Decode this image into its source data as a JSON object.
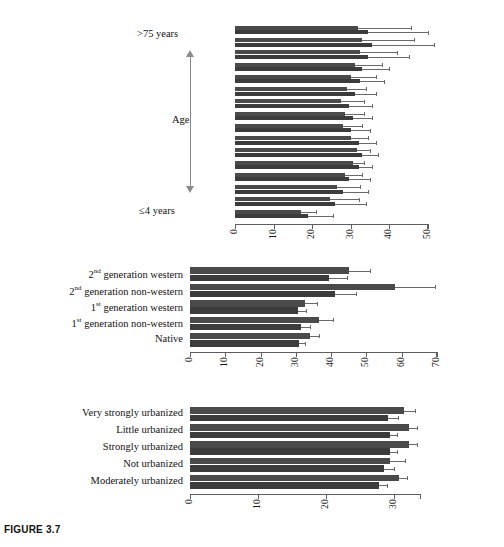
{
  "figure": {
    "caption": "FIGURE 3.7"
  },
  "chart_data": [
    {
      "id": "age-panel",
      "type": "bar",
      "orientation": "horizontal",
      "title": "",
      "xlabel": "",
      "ylabel": "Age",
      "axis_top_label": ">75 years",
      "axis_bottom_label": "≤4 years",
      "xlim": [
        0,
        50
      ],
      "xticks": [
        0,
        10,
        20,
        30,
        40,
        50
      ],
      "xticklabels": [
        "0",
        "10",
        "20",
        "30",
        "40",
        "50"
      ],
      "grid": false,
      "legend": "none",
      "categories": [
        ">75 years",
        "70-74 years",
        "65-69 years",
        "60-64 years",
        "55-59 years",
        "50-54 years",
        "45-49 years",
        "40-44 years",
        "35-39 years",
        "30-34 years",
        "25-29 years",
        "20-24 years",
        "15-19 years",
        "10-14 years",
        "5-9 years",
        "≤4 years"
      ],
      "series": [
        {
          "name": "series-1",
          "color": "#4a4a4a",
          "values": [
            31.8,
            33.0,
            32.5,
            31.0,
            30.0,
            29.0,
            27.5,
            28.5,
            28.0,
            30.0,
            31.5,
            30.5,
            28.5,
            26.5,
            24.5,
            17.0
          ],
          "errors_upper": [
            45.5,
            46.5,
            42.0,
            38.0,
            36.5,
            34.0,
            33.5,
            33.5,
            33.0,
            34.5,
            35.0,
            33.5,
            33.0,
            32.5,
            32.0,
            21.0
          ]
        },
        {
          "name": "series-2",
          "color": "#3c3c3c",
          "values": [
            34.5,
            35.5,
            34.5,
            33.0,
            32.5,
            31.0,
            29.5,
            30.5,
            30.0,
            32.0,
            33.0,
            32.0,
            29.5,
            28.0,
            26.0,
            19.0
          ],
          "errors_upper": [
            50.0,
            51.5,
            45.0,
            40.0,
            38.5,
            36.5,
            35.5,
            35.5,
            35.0,
            36.5,
            37.0,
            35.5,
            35.0,
            34.5,
            34.0,
            25.5
          ]
        }
      ]
    },
    {
      "id": "ethnicity-panel",
      "type": "bar",
      "orientation": "horizontal",
      "title": "",
      "xlabel": "",
      "ylabel": "",
      "xlim": [
        0,
        70
      ],
      "xticks": [
        0,
        10,
        20,
        30,
        40,
        50,
        60,
        70
      ],
      "xticklabels": [
        "0",
        "10",
        "20",
        "30",
        "40",
        "50",
        "60",
        "70"
      ],
      "grid": false,
      "legend": "none",
      "categories": [
        "2nd generation western",
        "2nd generation non-western",
        "1st generation western",
        "1st generation non-western",
        "Native"
      ],
      "category_labels_html": [
        "2<sup>nd</sup> generation western",
        "2<sup>nd</sup> generation non-western",
        "1<sup>st</sup> generation western",
        "1<sup>st</sup> generation non-western",
        "Native"
      ],
      "series": [
        {
          "name": "series-1",
          "color": "#4a4a4a",
          "values": [
            45.0,
            58.0,
            32.5,
            36.5,
            34.0
          ],
          "errors_upper": [
            51.0,
            69.5,
            36.0,
            40.5,
            36.5
          ]
        },
        {
          "name": "series-2",
          "color": "#3c3c3c",
          "values": [
            39.5,
            41.0,
            30.5,
            31.5,
            31.0
          ],
          "errors_upper": [
            44.5,
            47.0,
            33.0,
            34.0,
            32.5
          ]
        }
      ]
    },
    {
      "id": "urbanization-panel",
      "type": "bar",
      "orientation": "horizontal",
      "title": "",
      "xlabel": "",
      "ylabel": "",
      "xlim": [
        0,
        34
      ],
      "xticks": [
        0,
        10,
        20,
        30
      ],
      "xticklabels": [
        "0",
        "10",
        "20",
        "30"
      ],
      "grid": false,
      "legend": "none",
      "categories": [
        "Very strongly urbanized",
        "Little urbanized",
        "Strongly urbanized",
        "Not urbanized",
        "Moderately urbanized"
      ],
      "series": [
        {
          "name": "series-1",
          "color": "#4a4a4a",
          "values": [
            31.5,
            32.3,
            32.3,
            29.5,
            30.8
          ],
          "errors_upper": [
            33.1,
            33.4,
            33.4,
            31.6,
            32.0
          ]
        },
        {
          "name": "series-2",
          "color": "#3c3c3c",
          "values": [
            29.2,
            29.5,
            29.5,
            28.5,
            27.8
          ],
          "errors_upper": [
            30.6,
            30.5,
            30.5,
            30.0,
            29.0
          ]
        }
      ]
    }
  ]
}
